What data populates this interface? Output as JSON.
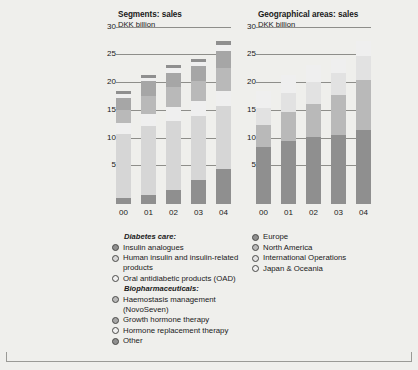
{
  "colors": {
    "dark": "#8f8f8f",
    "mid_dark": "#a6a6a6",
    "mid": "#b9b9b9",
    "mid_light": "#c9c9c9",
    "light": "#d6d6d6",
    "lighter": "#e2e2e2",
    "lightest": "#efefef",
    "gridline": "#8e8e8a",
    "background": "#efefec",
    "text": "#1a1a1a"
  },
  "left_panel": {
    "title": "Segments: sales",
    "unit": "DKK billion"
  },
  "right_panel": {
    "title": "Geographical areas: sales",
    "unit": "DKK billion"
  },
  "left_legend": {
    "groups": [
      {
        "heading": "Diabetes care:",
        "items": [
          {
            "label": "Insulin analogues",
            "color": "#8f8f8f"
          },
          {
            "label": "Human insulin and insulin-related products",
            "color": "#d6d6d6"
          },
          {
            "label": "Oral antidiabetic products (OAD)",
            "color": "#efefef"
          }
        ]
      },
      {
        "heading": "Biopharmaceuticals:",
        "items": [
          {
            "label": "Haemostasis management (NovoSeven)",
            "color": "#b9b9b9"
          },
          {
            "label": "Growth hormone therapy",
            "color": "#a6a6a6"
          },
          {
            "label": "Hormone replacement therapy",
            "color": "#efefef"
          },
          {
            "label": "Other",
            "color": "#8f8f8f"
          }
        ]
      }
    ]
  },
  "right_legend": {
    "items": [
      {
        "label": "Europe",
        "color": "#8f8f8f"
      },
      {
        "label": "North America",
        "color": "#b9b9b9"
      },
      {
        "label": "International Operations",
        "color": "#e2e2e2"
      },
      {
        "label": "Japan & Oceania",
        "color": "#efefef"
      }
    ]
  },
  "chart_data": [
    {
      "type": "bar",
      "stacked": true,
      "title": "Segments: sales",
      "subtitle": "DKK billion",
      "xlabel": "",
      "ylabel": "DKK billion",
      "ylim": [
        0,
        31
      ],
      "yticks": [
        5,
        10,
        15,
        20,
        25,
        30
      ],
      "grid": true,
      "legend_position": "below",
      "categories": [
        "00",
        "01",
        "02",
        "03",
        "04"
      ],
      "series": [
        {
          "name": "Insulin analogues",
          "color": "#8f8f8f",
          "values": [
            1.0,
            1.6,
            2.6,
            4.3,
            6.4
          ]
        },
        {
          "name": "Human insulin and insulin-related products",
          "color": "#d6d6d6",
          "values": [
            11.6,
            12.4,
            12.4,
            11.6,
            11.3
          ]
        },
        {
          "name": "Oral antidiabetic products (OAD)",
          "color": "#efefef",
          "values": [
            2.0,
            2.3,
            2.5,
            2.6,
            2.6
          ]
        },
        {
          "name": "Haemostasis management (NovoSeven)",
          "color": "#b9b9b9",
          "values": [
            2.3,
            3.2,
            3.6,
            3.6,
            4.2
          ]
        },
        {
          "name": "Growth hormone therapy",
          "color": "#a6a6a6",
          "values": [
            2.3,
            2.6,
            2.6,
            2.7,
            3.1
          ]
        },
        {
          "name": "Hormone replacement therapy",
          "color": "#efefef",
          "values": [
            0.6,
            0.7,
            0.8,
            0.8,
            1.0
          ]
        },
        {
          "name": "Other",
          "color": "#8f8f8f",
          "values": [
            0.5,
            0.5,
            0.5,
            0.5,
            0.8
          ]
        }
      ],
      "totals": [
        20.3,
        23.3,
        25.0,
        26.1,
        29.4
      ]
    },
    {
      "type": "bar",
      "stacked": true,
      "title": "Geographical areas: sales",
      "subtitle": "DKK billion",
      "xlabel": "",
      "ylabel": "DKK billion",
      "ylim": [
        0,
        31
      ],
      "yticks": [
        5,
        10,
        15,
        20,
        25,
        30
      ],
      "grid": true,
      "legend_position": "below",
      "categories": [
        "00",
        "01",
        "02",
        "03",
        "04"
      ],
      "series": [
        {
          "name": "Europe",
          "color": "#8f8f8f",
          "values": [
            10.2,
            11.3,
            12.1,
            12.5,
            13.3
          ]
        },
        {
          "name": "North America",
          "color": "#b9b9b9",
          "values": [
            4.0,
            5.2,
            6.0,
            7.1,
            9.1
          ]
        },
        {
          "name": "International Operations",
          "color": "#e2e2e2",
          "values": [
            3.1,
            3.6,
            3.9,
            4.0,
            4.2
          ]
        },
        {
          "name": "Japan & Oceania",
          "color": "#efefef",
          "values": [
            3.0,
            3.2,
            3.0,
            2.5,
            2.8
          ]
        }
      ],
      "totals": [
        20.3,
        23.3,
        25.0,
        26.1,
        29.4
      ]
    }
  ]
}
